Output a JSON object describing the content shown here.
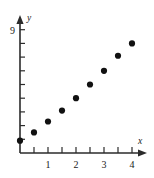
{
  "chart_data": {
    "type": "scatter",
    "title": "",
    "xlabel": "x",
    "ylabel": "y",
    "xlim": [
      0,
      4.4
    ],
    "ylim": [
      0,
      9.6
    ],
    "grid": false,
    "legend": null,
    "x_ticks_major": [
      1,
      2,
      3,
      4
    ],
    "x_ticks_minor": [
      0.5,
      1.5,
      2.5,
      3.5
    ],
    "x_tick_labels": [
      "1",
      "2",
      "3",
      "4"
    ],
    "y_ticks_major": [
      9
    ],
    "y_tick_labels": [
      "9"
    ],
    "y_ticks_minor": [
      1,
      2,
      3,
      4,
      5,
      6,
      7,
      8
    ],
    "point_count": 9,
    "x": [
      0,
      0.5,
      1,
      1.5,
      2,
      2.5,
      3,
      3.5,
      4
    ],
    "values": [
      0.9,
      1.5,
      2.3,
      3.1,
      4.0,
      5.0,
      6.0,
      7.1,
      8.0
    ],
    "points": [
      {
        "x": 0,
        "y": 0.9
      },
      {
        "x": 0.5,
        "y": 1.5
      },
      {
        "x": 1,
        "y": 2.3
      },
      {
        "x": 1.5,
        "y": 3.1
      },
      {
        "x": 2,
        "y": 4.0
      },
      {
        "x": 2.5,
        "y": 5.0
      },
      {
        "x": 3,
        "y": 6.0
      },
      {
        "x": 3.5,
        "y": 7.1
      },
      {
        "x": 4,
        "y": 8.0
      }
    ],
    "marker": "filled-circle",
    "marker_color": "#111111",
    "axis_color": "#2b2b2b",
    "background_color": "#ffffff"
  },
  "axis_labels": {
    "x_axis_name": "x",
    "y_axis_name": "y"
  },
  "y_axis_top_label": "9"
}
